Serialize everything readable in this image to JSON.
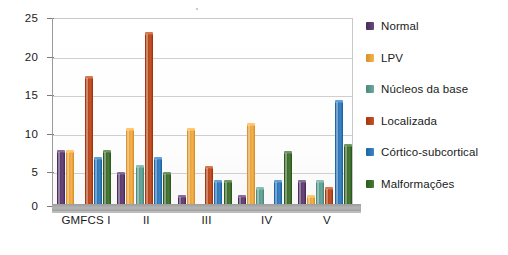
{
  "chart_data": {
    "type": "bar",
    "title": "",
    "subtitle": "",
    "xlabel": "",
    "ylabel": "",
    "ylim": [
      0,
      25
    ],
    "yticks": [
      0,
      5,
      10,
      15,
      20,
      25
    ],
    "ytick_labels": [
      "0",
      "5",
      "10",
      "15",
      "20",
      "25"
    ],
    "grid": true,
    "legend_position": "right",
    "categories": [
      "GMFCS I",
      "II",
      "III",
      "IV",
      "V"
    ],
    "series": [
      {
        "name": "Normal",
        "color": "#5B3A6E",
        "values": [
          7,
          4,
          1,
          1,
          3
        ]
      },
      {
        "name": "LPV",
        "color": "#E8A33D",
        "values": [
          7,
          10,
          10,
          10.6,
          1
        ]
      },
      {
        "name": "Núcleos da base",
        "color": "#5C9A8F",
        "values": [
          0,
          5,
          0,
          2,
          3
        ]
      },
      {
        "name": "Localizada",
        "color": "#B5451B",
        "values": [
          17,
          22.8,
          4.8,
          0,
          2
        ]
      },
      {
        "name": "Córtico-subcortical",
        "color": "#2E75B6",
        "values": [
          6,
          6,
          3,
          3,
          13.7
        ]
      },
      {
        "name": "Malformações",
        "color": "#3D6B2E",
        "values": [
          7,
          4,
          3,
          6.8,
          7.8
        ]
      }
    ]
  },
  "legend": {
    "items": [
      {
        "label": "Normal"
      },
      {
        "label": "LPV"
      },
      {
        "label": "Núcleos da base"
      },
      {
        "label": "Localizada"
      },
      {
        "label": "Córtico-subcortical"
      },
      {
        "label": "Malformações"
      }
    ]
  },
  "axes": {
    "y_labels": [
      "25",
      "20",
      "15",
      "10",
      "5",
      "0"
    ],
    "x_labels": [
      "GMFCS I",
      "II",
      "III",
      "IV",
      "V"
    ]
  }
}
